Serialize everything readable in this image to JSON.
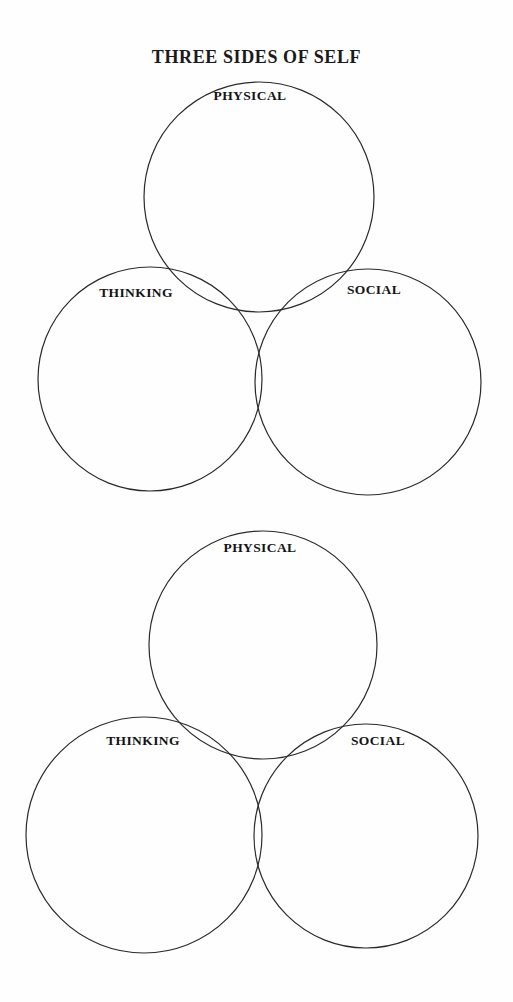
{
  "page": {
    "title": "THREE SIDES OF SELF",
    "background_color": "#fdfdfd",
    "ink_color": "#2a2a2a",
    "text_color": "#141414"
  },
  "diagrams": [
    {
      "name": "three-sides-of-self-venn-top",
      "circles": [
        {
          "name": "physical",
          "label": "PHYSICAL",
          "cx": 259,
          "cy": 197,
          "r": 115,
          "label_x": 250,
          "label_y": 89
        },
        {
          "name": "thinking",
          "label": "THINKING",
          "cx": 150,
          "cy": 379,
          "r": 112,
          "label_x": 136,
          "label_y": 286
        },
        {
          "name": "social",
          "label": "SOCIAL",
          "cx": 368,
          "cy": 382,
          "r": 113,
          "label_x": 374,
          "label_y": 283
        }
      ]
    },
    {
      "name": "three-sides-of-self-venn-bottom",
      "circles": [
        {
          "name": "physical",
          "label": "PHYSICAL",
          "cx": 263,
          "cy": 645,
          "r": 114,
          "label_x": 260,
          "label_y": 541
        },
        {
          "name": "thinking",
          "label": "THINKING",
          "cx": 144,
          "cy": 835,
          "r": 118,
          "label_x": 143,
          "label_y": 734
        },
        {
          "name": "social",
          "label": "SOCIAL",
          "cx": 366,
          "cy": 836,
          "r": 112,
          "label_x": 378,
          "label_y": 734
        }
      ]
    }
  ]
}
